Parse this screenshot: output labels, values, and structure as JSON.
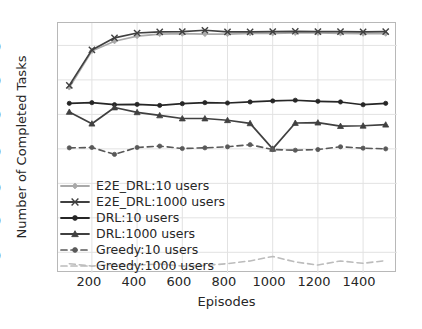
{
  "chart_data": {
    "type": "line",
    "title": "",
    "xlabel": "Episodes",
    "ylabel": "Number of Completed Tasks",
    "x": [
      100,
      200,
      300,
      400,
      500,
      600,
      700,
      800,
      900,
      1000,
      1100,
      1200,
      1300,
      1400,
      1500
    ],
    "xlim": [
      50,
      1550
    ],
    "ylim": [
      140,
      865
    ],
    "xticks": [
      200,
      400,
      600,
      800,
      1000,
      1200,
      1400
    ],
    "yticks": [
      200,
      300,
      400,
      500,
      600,
      700,
      800
    ],
    "grid": true,
    "legend_position": "lower left",
    "series": [
      {
        "name": "E2E_DRL:10 users",
        "color": "#a9a9a9",
        "marker": "diamond",
        "linestyle": "solid",
        "values": [
          678,
          784,
          812,
          827,
          833,
          834,
          833,
          833,
          835,
          835,
          836,
          836,
          835,
          834,
          834
        ]
      },
      {
        "name": "E2E_DRL:1000 users",
        "color": "#404040",
        "marker": "x",
        "linestyle": "solid",
        "values": [
          684,
          787,
          822,
          836,
          839,
          840,
          844,
          839,
          839,
          840,
          841,
          840,
          840,
          839,
          840
        ]
      },
      {
        "name": "DRL:10 users",
        "color": "#262626",
        "marker": "circle",
        "linestyle": "solid",
        "values": [
          632,
          634,
          628,
          629,
          626,
          631,
          634,
          633,
          636,
          639,
          641,
          638,
          636,
          628,
          632
        ]
      },
      {
        "name": "DRL:1000 users",
        "color": "#404040",
        "marker": "triangle",
        "linestyle": "solid",
        "values": [
          607,
          573,
          620,
          606,
          597,
          588,
          588,
          583,
          574,
          500,
          575,
          576,
          566,
          567,
          570
        ]
      },
      {
        "name": "Greedy:10 users",
        "color": "#595959",
        "marker": "circle",
        "linestyle": "dashed",
        "values": [
          503,
          504,
          484,
          504,
          508,
          501,
          503,
          506,
          512,
          498,
          496,
          498,
          506,
          502,
          500
        ]
      },
      {
        "name": "Greedy:1000 users",
        "color": "#bcbcbc",
        "marker": "none",
        "linestyle": "dashed",
        "values": [
          167,
          160,
          165,
          163,
          166,
          160,
          162,
          167,
          175,
          188,
          172,
          163,
          175,
          168,
          176
        ]
      }
    ]
  },
  "axes": {
    "ytick_labels": [
      "800",
      "700",
      "600",
      "500",
      "400",
      "300",
      "200"
    ],
    "xtick_labels": [
      "200",
      "400",
      "600",
      "800",
      "1000",
      "1200",
      "1400"
    ],
    "xlabel": "Episodes",
    "ylabel": "Number of Completed Tasks"
  },
  "legend": {
    "items": [
      {
        "label": "E2E_DRL:10 users"
      },
      {
        "label": "E2E_DRL:1000 users"
      },
      {
        "label": "DRL:10 users"
      },
      {
        "label": "DRL:1000 users"
      },
      {
        "label": "Greedy:10 users"
      },
      {
        "label": "Greedy:1000 users"
      }
    ]
  }
}
